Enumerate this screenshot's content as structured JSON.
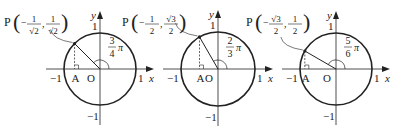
{
  "figures": [
    {
      "id": "fig-3pi4",
      "center": [
        100,
        69
      ],
      "radius": 36,
      "angle_deg": 135,
      "point_label": "P",
      "x_coord": {
        "sign": "−",
        "num": "1",
        "den": "√2"
      },
      "y_coord": {
        "sign": "",
        "num": "1",
        "den": "√2"
      },
      "angle_label": {
        "num": "3",
        "den": "4",
        "suffix": "π"
      },
      "labels": {
        "neg_one_x": "−1",
        "A": "A",
        "O": "O",
        "one_x": "1",
        "x": "x",
        "y": "y",
        "one_y": "1",
        "neg_one_y": "−1"
      }
    },
    {
      "id": "fig-2pi3",
      "center": [
        218,
        69
      ],
      "radius": 37,
      "angle_deg": 120,
      "point_label": "P",
      "x_coord": {
        "sign": "−",
        "num": "1",
        "den": "2"
      },
      "y_coord": {
        "sign": "",
        "num": "√3",
        "den": "2"
      },
      "angle_label": {
        "num": "2",
        "den": "3",
        "suffix": "π"
      },
      "labels": {
        "neg_one_x": "−1",
        "A": "A",
        "O": "O",
        "one_x": "1",
        "x": "x",
        "y": "y",
        "one_y": "1",
        "neg_one_y": "−1"
      }
    },
    {
      "id": "fig-5pi6",
      "center": [
        336,
        69
      ],
      "radius": 36,
      "angle_deg": 150,
      "point_label": "P",
      "x_coord": {
        "sign": "−",
        "num": "√3",
        "den": "2"
      },
      "y_coord": {
        "sign": "",
        "num": "1",
        "den": "2"
      },
      "angle_label": {
        "num": "5",
        "den": "6",
        "suffix": "π"
      },
      "labels": {
        "neg_one_x": "−1",
        "A": "A",
        "O": "O",
        "one_x": "1",
        "x": "x",
        "y": "y",
        "one_y": "1",
        "neg_one_y": "−1"
      }
    }
  ],
  "colors": {
    "stroke": "#222222",
    "background": "#ffffff"
  }
}
